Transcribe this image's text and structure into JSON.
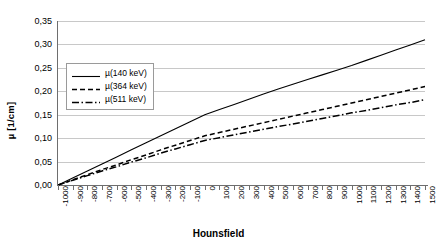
{
  "chart_data": {
    "type": "line",
    "title": "",
    "xlabel": "Hounsfield",
    "ylabel": "µ [1/cm]",
    "xlim": [
      -1000,
      1500
    ],
    "ylim": [
      0.0,
      0.35
    ],
    "ytick_step": 0.05,
    "xtick_step": 100,
    "grid": true,
    "decimal_separator": ",",
    "legend_position": "upper-left-inside",
    "ytick_labels": [
      "0,00",
      "0,05",
      "0,10",
      "0,15",
      "0,20",
      "0,25",
      "0,30",
      "0,35"
    ],
    "ytick_values": [
      0.0,
      0.05,
      0.1,
      0.15,
      0.2,
      0.25,
      0.3,
      0.35
    ],
    "xtick_labels": [
      "-1000",
      "-900",
      "-800",
      "-700",
      "-600",
      "-500",
      "-400",
      "-300",
      "-200",
      "-100",
      "0",
      "100",
      "200",
      "300",
      "400",
      "500",
      "600",
      "700",
      "800",
      "900",
      "1000",
      "1100",
      "1200",
      "1300",
      "1400",
      "1500"
    ],
    "x": [
      -1000,
      -900,
      -800,
      -700,
      -600,
      -500,
      -400,
      -300,
      -200,
      -100,
      0,
      100,
      200,
      300,
      400,
      500,
      600,
      700,
      800,
      900,
      1000,
      1100,
      1200,
      1300,
      1400,
      1500
    ],
    "series": [
      {
        "name": "µ(140 keV)",
        "style": "solid",
        "color": "#000000",
        "values": [
          0.0,
          0.015,
          0.03,
          0.045,
          0.06,
          0.075,
          0.09,
          0.105,
          0.12,
          0.135,
          0.15,
          0.161,
          0.172,
          0.183,
          0.194,
          0.205,
          0.215,
          0.225,
          0.235,
          0.245,
          0.255,
          0.266,
          0.277,
          0.288,
          0.299,
          0.31
        ]
      },
      {
        "name": "µ(364 keV)",
        "style": "dashed",
        "color": "#000000",
        "values": [
          0.0,
          0.011,
          0.022,
          0.033,
          0.043,
          0.054,
          0.064,
          0.075,
          0.085,
          0.095,
          0.105,
          0.112,
          0.119,
          0.126,
          0.133,
          0.14,
          0.147,
          0.154,
          0.161,
          0.168,
          0.175,
          0.182,
          0.189,
          0.196,
          0.203,
          0.21
        ]
      },
      {
        "name": "µ(511 keV)",
        "style": "dashdot",
        "color": "#000000",
        "values": [
          0.0,
          0.01,
          0.02,
          0.03,
          0.039,
          0.049,
          0.058,
          0.068,
          0.077,
          0.086,
          0.095,
          0.101,
          0.107,
          0.113,
          0.119,
          0.125,
          0.13,
          0.136,
          0.142,
          0.148,
          0.154,
          0.159,
          0.165,
          0.171,
          0.176,
          0.182
        ]
      }
    ]
  }
}
